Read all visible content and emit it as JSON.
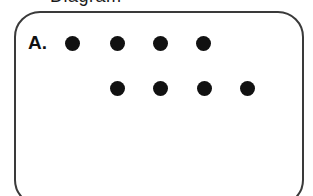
{
  "header": {
    "cut_off_text": "Diagram"
  },
  "panel": {
    "label": "A.",
    "border_color": "#3a3a3a",
    "dot_color": "#111111",
    "rows": [
      {
        "name": "top-row",
        "dot_count": 4,
        "centers_x": [
          72,
          117,
          160,
          203
        ],
        "center_y": 43
      },
      {
        "name": "bottom-row",
        "dot_count": 4,
        "centers_x": [
          117,
          160,
          204,
          247
        ],
        "center_y": 88
      }
    ],
    "total_dots": 8
  }
}
